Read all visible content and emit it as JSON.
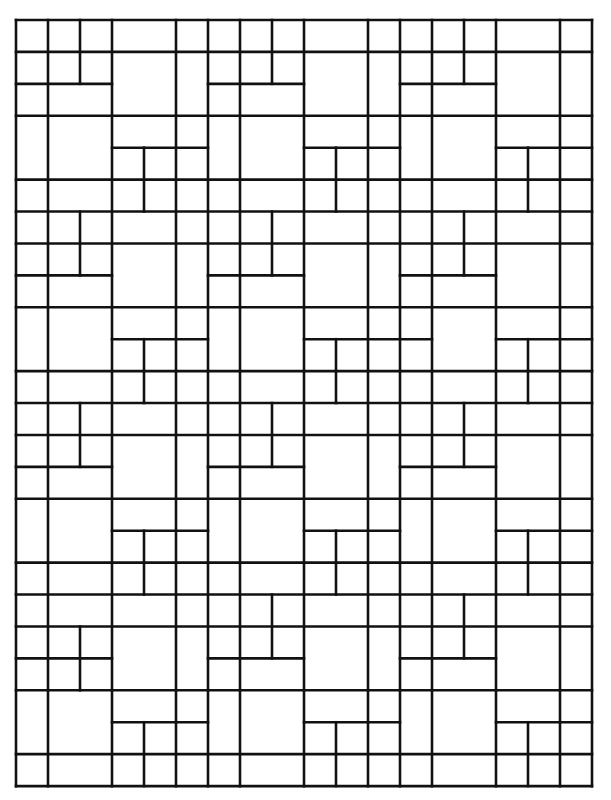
{
  "style": {
    "background": "#ffffff",
    "line_color": "#111111",
    "line_width": 2.6
  },
  "grid": {
    "origin_x": 16,
    "origin_y": 20,
    "cols": 18,
    "rows": 24,
    "unit_x": 32,
    "unit_y": 31.92
  },
  "horizontal_segments": [
    {
      "r": 0,
      "c0": 0,
      "c1": 18
    },
    {
      "r": 1,
      "c0": 0,
      "c1": 18
    },
    {
      "r": 2,
      "c0": 0,
      "c1": 3
    },
    {
      "r": 2,
      "c0": 6,
      "c1": 9
    },
    {
      "r": 2,
      "c0": 12,
      "c1": 15
    },
    {
      "r": 3,
      "c0": 0,
      "c1": 18
    },
    {
      "r": 4,
      "c0": 3,
      "c1": 6
    },
    {
      "r": 4,
      "c0": 9,
      "c1": 12
    },
    {
      "r": 4,
      "c0": 15,
      "c1": 18
    },
    {
      "r": 5,
      "c0": 0,
      "c1": 18
    },
    {
      "r": 6,
      "c0": 0,
      "c1": 18
    },
    {
      "r": 7,
      "c0": 0,
      "c1": 18
    },
    {
      "r": 8,
      "c0": 0,
      "c1": 3
    },
    {
      "r": 8,
      "c0": 6,
      "c1": 9
    },
    {
      "r": 8,
      "c0": 12,
      "c1": 15
    },
    {
      "r": 9,
      "c0": 0,
      "c1": 18
    },
    {
      "r": 10,
      "c0": 3,
      "c1": 6
    },
    {
      "r": 10,
      "c0": 9,
      "c1": 13
    },
    {
      "r": 10,
      "c0": 15,
      "c1": 18
    },
    {
      "r": 11,
      "c0": 0,
      "c1": 18
    },
    {
      "r": 12,
      "c0": 0,
      "c1": 18
    },
    {
      "r": 13,
      "c0": 0,
      "c1": 18
    },
    {
      "r": 14,
      "c0": 0,
      "c1": 3
    },
    {
      "r": 14,
      "c0": 6,
      "c1": 9
    },
    {
      "r": 14,
      "c0": 12,
      "c1": 15
    },
    {
      "r": 15,
      "c0": 0,
      "c1": 18
    },
    {
      "r": 16,
      "c0": 3,
      "c1": 6
    },
    {
      "r": 16,
      "c0": 9,
      "c1": 12
    },
    {
      "r": 16,
      "c0": 15,
      "c1": 18
    },
    {
      "r": 17,
      "c0": 0,
      "c1": 18
    },
    {
      "r": 18,
      "c0": 0,
      "c1": 18
    },
    {
      "r": 19,
      "c0": 0,
      "c1": 18
    },
    {
      "r": 20,
      "c0": 0,
      "c1": 3
    },
    {
      "r": 20,
      "c0": 6,
      "c1": 9
    },
    {
      "r": 20,
      "c0": 12,
      "c1": 15
    },
    {
      "r": 21,
      "c0": 0,
      "c1": 18
    },
    {
      "r": 22,
      "c0": 3,
      "c1": 6
    },
    {
      "r": 22,
      "c0": 9,
      "c1": 12
    },
    {
      "r": 22,
      "c0": 15,
      "c1": 18
    },
    {
      "r": 23,
      "c0": 0,
      "c1": 18
    },
    {
      "r": 24,
      "c0": 0,
      "c1": 18
    }
  ],
  "vertical_segments": [
    {
      "c": 0,
      "r0": 0,
      "r1": 24
    },
    {
      "c": 1,
      "r0": 0,
      "r1": 24
    },
    {
      "c": 2,
      "r0": 0,
      "r1": 2
    },
    {
      "c": 2,
      "r0": 6,
      "r1": 8
    },
    {
      "c": 2,
      "r0": 12,
      "r1": 14
    },
    {
      "c": 2,
      "r0": 19,
      "r1": 21
    },
    {
      "c": 3,
      "r0": 0,
      "r1": 24
    },
    {
      "c": 4,
      "r0": 4,
      "r1": 6
    },
    {
      "c": 4,
      "r0": 10,
      "r1": 12
    },
    {
      "c": 4,
      "r0": 16,
      "r1": 18
    },
    {
      "c": 4,
      "r0": 22,
      "r1": 24
    },
    {
      "c": 5,
      "r0": 0,
      "r1": 24
    },
    {
      "c": 6,
      "r0": 0,
      "r1": 24
    },
    {
      "c": 7,
      "r0": 0,
      "r1": 24
    },
    {
      "c": 8,
      "r0": 0,
      "r1": 2
    },
    {
      "c": 8,
      "r0": 6,
      "r1": 8
    },
    {
      "c": 8,
      "r0": 12,
      "r1": 14
    },
    {
      "c": 8,
      "r0": 18,
      "r1": 20
    },
    {
      "c": 9,
      "r0": 0,
      "r1": 24
    },
    {
      "c": 10,
      "r0": 4,
      "r1": 6
    },
    {
      "c": 10,
      "r0": 10,
      "r1": 12
    },
    {
      "c": 10,
      "r0": 16,
      "r1": 18
    },
    {
      "c": 10,
      "r0": 22,
      "r1": 24
    },
    {
      "c": 11,
      "r0": 0,
      "r1": 24
    },
    {
      "c": 12,
      "r0": 0,
      "r1": 24
    },
    {
      "c": 13,
      "r0": 0,
      "r1": 24
    },
    {
      "c": 14,
      "r0": 0,
      "r1": 2
    },
    {
      "c": 14,
      "r0": 6,
      "r1": 8
    },
    {
      "c": 14,
      "r0": 12,
      "r1": 14
    },
    {
      "c": 14,
      "r0": 18,
      "r1": 20
    },
    {
      "c": 15,
      "r0": 0,
      "r1": 24
    },
    {
      "c": 16,
      "r0": 4,
      "r1": 6
    },
    {
      "c": 16,
      "r0": 10,
      "r1": 12
    },
    {
      "c": 16,
      "r0": 16,
      "r1": 18
    },
    {
      "c": 16,
      "r0": 22,
      "r1": 24
    },
    {
      "c": 17,
      "r0": 0,
      "r1": 24
    },
    {
      "c": 18,
      "r0": 0,
      "r1": 24
    }
  ]
}
